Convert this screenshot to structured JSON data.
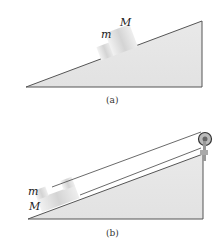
{
  "figure_a": {
    "caption": "(a)",
    "label_small_block": "m",
    "label_large_block": "M"
  },
  "figure_b": {
    "caption": "(b)",
    "label_small_block": "m",
    "label_large_block": "M"
  },
  "colors": {
    "wedge_fill": "#e6e6e6",
    "wedge_stroke": "#555555",
    "block_fill": "#d8d8d8",
    "string": "#444444"
  }
}
